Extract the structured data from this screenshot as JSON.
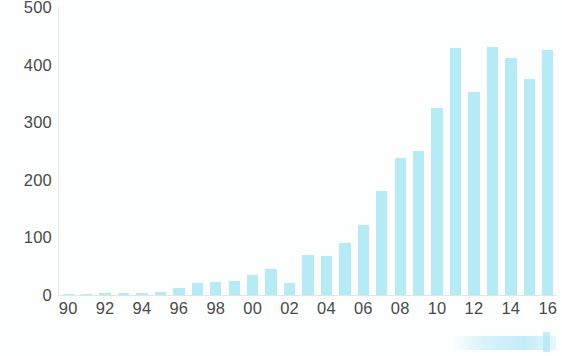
{
  "chart_data": {
    "type": "bar",
    "title": "",
    "subtitle": "",
    "xlabel": "",
    "ylabel": "",
    "categories": [
      "90",
      "91",
      "92",
      "93",
      "94",
      "95",
      "96",
      "97",
      "98",
      "99",
      "00",
      "01",
      "02",
      "03",
      "04",
      "05",
      "06",
      "07",
      "08",
      "09",
      "10",
      "11",
      "12",
      "13",
      "14",
      "15",
      "16"
    ],
    "values": [
      2,
      2,
      3,
      3,
      4,
      5,
      12,
      20,
      22,
      25,
      35,
      45,
      20,
      70,
      68,
      90,
      122,
      180,
      238,
      250,
      325,
      428,
      352,
      430,
      412,
      375,
      425
    ],
    "tick_labels_x": [
      "90",
      "92",
      "94",
      "96",
      "98",
      "00",
      "02",
      "04",
      "06",
      "08",
      "10",
      "12",
      "14",
      "16"
    ],
    "tick_labels_y": [
      "0",
      "100",
      "200",
      "300",
      "400",
      "500"
    ],
    "tick_values_y": [
      0,
      100,
      200,
      300,
      400,
      500
    ],
    "ylim": [
      0,
      500
    ],
    "grid": false,
    "legend": null,
    "legend_position": "none",
    "bar_color": "#b6ebf6",
    "axis_color": "#e4eaec",
    "text_color": "#4a4a4a",
    "annotations": []
  }
}
